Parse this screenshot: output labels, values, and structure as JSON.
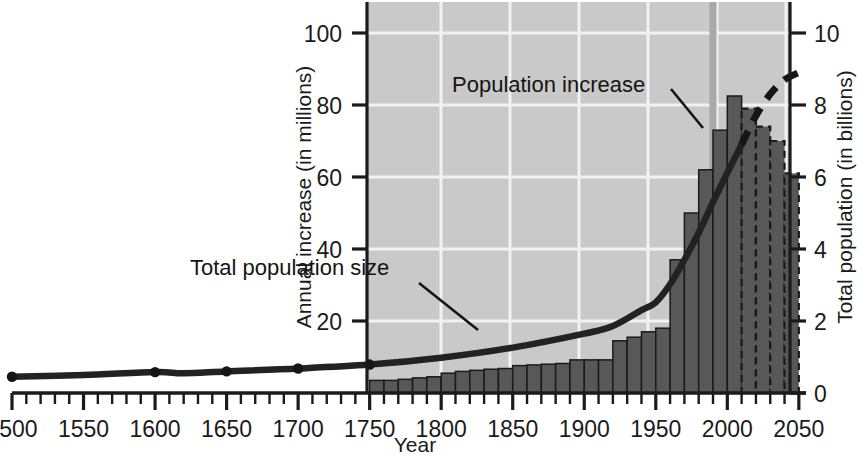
{
  "chart_data": {
    "type": "bar",
    "title": "",
    "subtitle": "",
    "xlabel": "Year",
    "ylabel": "Annual increase (in millions)",
    "y2label": "Total population (in billions)",
    "xlim": [
      1500,
      2055
    ],
    "ylim": [
      0,
      105
    ],
    "y2lim": [
      0,
      10.5
    ],
    "grid": true,
    "legend_position": "inline-annotations",
    "x_tick_labels": [
      "1500",
      "1550",
      "1600",
      "1650",
      "1700",
      "1750",
      "1800",
      "1850",
      "1900",
      "1950",
      "2000",
      "2050"
    ],
    "x_ticks": [
      1500,
      1550,
      1600,
      1650,
      1700,
      1750,
      1800,
      1850,
      1900,
      1950,
      2000,
      2050
    ],
    "x_minor_tick_step": 10,
    "y_tick_labels": [
      "20",
      "40",
      "60",
      "80",
      "100"
    ],
    "y_ticks": [
      20,
      40,
      60,
      80,
      100
    ],
    "y2_tick_labels": [
      "0",
      "2",
      "4",
      "6",
      "8",
      "10"
    ],
    "y2_ticks": [
      0,
      2,
      4,
      6,
      8,
      10
    ],
    "plot_area_x_range": [
      1750,
      2055
    ],
    "projection_start_year": 2010,
    "annotations": [
      {
        "text": "Population increase",
        "x": 1880,
        "y": 86,
        "points_to_x": 1985,
        "points_to_y": 72
      },
      {
        "text": "Total population size",
        "x": 1800,
        "y": 29,
        "points_to_x": 1878,
        "points_to_y": 16
      }
    ],
    "series": [
      {
        "name": "Population increase",
        "type": "bar",
        "unit": "millions per year",
        "axis": "left",
        "bin_width_years": 10,
        "categories": [
          1750,
          1760,
          1770,
          1780,
          1790,
          1800,
          1810,
          1820,
          1830,
          1840,
          1850,
          1860,
          1870,
          1880,
          1890,
          1900,
          1910,
          1920,
          1930,
          1940,
          1950,
          1960,
          1970,
          1980,
          1990,
          2000,
          2010,
          2020,
          2030,
          2040
        ],
        "values": [
          3.5,
          3.5,
          3.8,
          4.2,
          4.5,
          5.5,
          6.0,
          6.3,
          6.6,
          6.8,
          7.6,
          7.8,
          8.0,
          8.2,
          9.2,
          9.2,
          9.2,
          14.5,
          15.5,
          17.0,
          18.0,
          37.0,
          50.0,
          62.0,
          73.0,
          82.5,
          79.0,
          74.0,
          70.0,
          61.0
        ],
        "projection_values": [
          61.0,
          46.0,
          33.0
        ],
        "projection_categories": [
          2020,
          2030,
          2040
        ]
      },
      {
        "name": "Total population size",
        "type": "line",
        "unit": "billions",
        "axis": "right",
        "x": [
          1500,
          1550,
          1600,
          1620,
          1650,
          1700,
          1750,
          1800,
          1850,
          1900,
          1920,
          1940,
          1950,
          1960,
          1970,
          1980,
          1990,
          2000,
          2010
        ],
        "values": [
          0.45,
          0.5,
          0.58,
          0.55,
          0.6,
          0.68,
          0.79,
          0.98,
          1.26,
          1.65,
          1.86,
          2.3,
          2.52,
          3.02,
          3.7,
          4.45,
          5.3,
          6.12,
          6.9
        ],
        "marker_points_x": [
          1500,
          1600,
          1650,
          1700,
          1750
        ],
        "projection_x": [
          2010,
          2020,
          2030,
          2040,
          2050
        ],
        "projection_values": [
          6.9,
          7.7,
          8.3,
          8.7,
          8.9
        ]
      }
    ]
  },
  "style": {
    "plot_background": "#c9c9c9",
    "gridline_color": "#f2f2f2",
    "bar_fill": "#585858",
    "bar_stroke": "#1a1a1a",
    "line_color": "#222222",
    "marker_line_color": "#a8a8a8",
    "axis_color": "#1b1b1b",
    "page_background": "#ffffff"
  }
}
